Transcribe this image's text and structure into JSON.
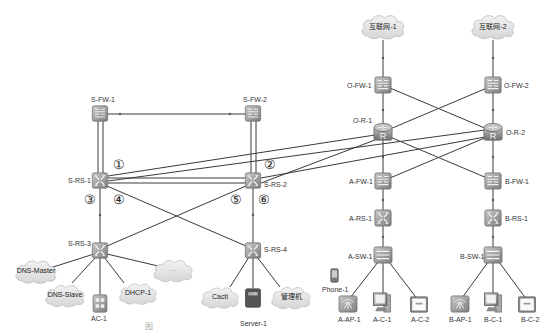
{
  "diagram": {
    "type": "network-topology",
    "colors": {
      "line": "#3a3a3a",
      "device": "#9a9a9a",
      "cloud": "#e6e6e6",
      "text": "#333333"
    },
    "clouds": [
      {
        "id": "inet1",
        "label": "互联网-1"
      },
      {
        "id": "inet2",
        "label": "互联网-2"
      },
      {
        "id": "dns_master",
        "label": "DNS-Master"
      },
      {
        "id": "dns_slave",
        "label": "DNS-Slave"
      },
      {
        "id": "dhcp1",
        "label": "DHCP-1"
      },
      {
        "id": "unnamed",
        "label": "—"
      },
      {
        "id": "cacti",
        "label": "Cacti"
      },
      {
        "id": "mgmt",
        "label": "管理机"
      }
    ],
    "nodes": [
      {
        "id": "sfw1",
        "label": "S-FW-1",
        "kind": "firewall"
      },
      {
        "id": "sfw2",
        "label": "S-FW-2",
        "kind": "firewall"
      },
      {
        "id": "srs1",
        "label": "S-RS-1",
        "kind": "l3-switch"
      },
      {
        "id": "srs2",
        "label": "S-RS-2",
        "kind": "l3-switch"
      },
      {
        "id": "srs3",
        "label": "S-RS-3",
        "kind": "l3-switch"
      },
      {
        "id": "srs4",
        "label": "S-RS-4",
        "kind": "l3-switch"
      },
      {
        "id": "ac1",
        "label": "AC-1",
        "kind": "controller"
      },
      {
        "id": "server1",
        "label": "Server-1",
        "kind": "server"
      },
      {
        "id": "ofw1",
        "label": "O-FW-1",
        "kind": "firewall"
      },
      {
        "id": "ofw2",
        "label": "O-FW-2",
        "kind": "firewall"
      },
      {
        "id": "or1",
        "label": "O-R-1",
        "kind": "router"
      },
      {
        "id": "or2",
        "label": "O-R-2",
        "kind": "router"
      },
      {
        "id": "afw1",
        "label": "A-FW-1",
        "kind": "firewall"
      },
      {
        "id": "bfw1",
        "label": "B-FW-1",
        "kind": "firewall"
      },
      {
        "id": "ars1",
        "label": "A-RS-1",
        "kind": "l3-switch"
      },
      {
        "id": "brs1",
        "label": "B-RS-1",
        "kind": "l3-switch"
      },
      {
        "id": "asw1",
        "label": "A-SW-1",
        "kind": "switch"
      },
      {
        "id": "bsw1",
        "label": "B-SW-1",
        "kind": "switch"
      },
      {
        "id": "phone1",
        "label": "Phone-1",
        "kind": "phone"
      },
      {
        "id": "aap1",
        "label": "A-AP-1",
        "kind": "ap"
      },
      {
        "id": "ac1pc",
        "label": "A-C-1",
        "kind": "pc"
      },
      {
        "id": "ac2",
        "label": "A-C-2",
        "kind": "terminal"
      },
      {
        "id": "bap1",
        "label": "B-AP-1",
        "kind": "ap"
      },
      {
        "id": "bc1",
        "label": "B-C-1",
        "kind": "pc"
      },
      {
        "id": "bc2",
        "label": "B-C-2",
        "kind": "terminal"
      }
    ],
    "link_markers": [
      "①",
      "②",
      "③",
      "④",
      "⑤",
      "⑥"
    ],
    "caption": "图"
  }
}
